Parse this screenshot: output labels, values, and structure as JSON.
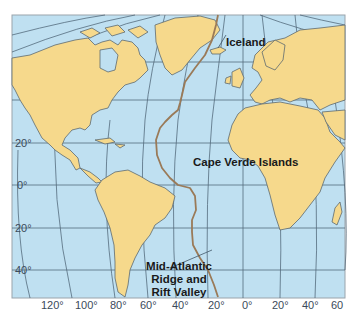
{
  "map": {
    "title": "Mid-Atlantic Ridge",
    "colors": {
      "ocean": "#bfe0f1",
      "land": "#f6d98c",
      "coast": "#5d6a70",
      "grid": "#42586a",
      "ridge": "#9a7a58",
      "frame": "#9aa4ab"
    },
    "features": {
      "iceland": "Iceland",
      "cape_verde": "Cape Verde Islands",
      "ridge_line1": "Mid-Atlantic",
      "ridge_line2": "Ridge and",
      "ridge_line3": "Rift Valley"
    },
    "latitude_labels": [
      "20°",
      "0°",
      "20°",
      "40°"
    ],
    "longitude_labels": [
      "120°",
      "100°",
      "80°",
      "60°",
      "40°",
      "20°",
      "0°",
      "20°",
      "40°",
      "60"
    ]
  }
}
